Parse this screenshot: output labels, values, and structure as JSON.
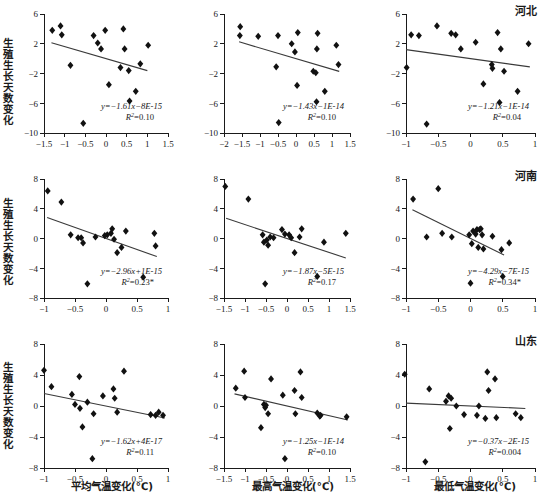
{
  "figure": {
    "width": 547,
    "height": 500,
    "rows": 3,
    "cols": 3,
    "marker_color": "#111111",
    "trend_color": "#3a3a3a",
    "axis_color": "#1a1a1a"
  },
  "axis_titles": {
    "y_label": "生殖生长天数变化",
    "x_labels": [
      "平均气温变化(℃)",
      "最高气温变化(℃)",
      "最低气温变化(℃)"
    ]
  },
  "region_labels": [
    "河北",
    "河南",
    "山东"
  ],
  "chart_data": [
    {
      "type": "scatter",
      "row": 0,
      "col": 0,
      "region": "河北",
      "title": "",
      "xlabel": "平均气温变化(℃)",
      "ylabel": "生殖生长天数变化",
      "xlim": [
        -1.5,
        1.5
      ],
      "ylim": [
        -10,
        6
      ],
      "xticks": [
        -1.5,
        -1,
        -0.5,
        0,
        0.5,
        1,
        1.5
      ],
      "xticklabels": [
        "−1.5",
        "−1",
        "−0.5",
        "0",
        "0.5",
        "1",
        "1.5"
      ],
      "yticks": [
        -10,
        -6,
        -2,
        2,
        6
      ],
      "yticklabels": [
        "−10",
        "−6",
        "−2",
        "2",
        "6"
      ],
      "grid": false,
      "equation": "y=−1.61x−8E-15",
      "r2": "R²=0.10",
      "slope": -1.61,
      "intercept": 0,
      "r_squared": 0.1,
      "significant": false,
      "trend_x": [
        -1.32,
        1.0
      ],
      "points": [
        {
          "x": -1.3,
          "y": 3.8
        },
        {
          "x": -1.1,
          "y": 4.4
        },
        {
          "x": -1.07,
          "y": 3.2
        },
        {
          "x": -0.86,
          "y": -0.9
        },
        {
          "x": -0.3,
          "y": 3.1
        },
        {
          "x": -0.2,
          "y": 2.1
        },
        {
          "x": -0.12,
          "y": 1.3
        },
        {
          "x": -0.02,
          "y": 3.8
        },
        {
          "x": 0.07,
          "y": -3.5
        },
        {
          "x": 0.35,
          "y": -1.2
        },
        {
          "x": 0.42,
          "y": 4.0
        },
        {
          "x": 0.45,
          "y": 1.3
        },
        {
          "x": 0.55,
          "y": -1.6
        },
        {
          "x": 0.57,
          "y": -5.7
        },
        {
          "x": 0.72,
          "y": -4.4
        },
        {
          "x": 0.83,
          "y": -0.7
        },
        {
          "x": 1.02,
          "y": 1.8
        },
        {
          "x": -0.55,
          "y": -8.7
        }
      ]
    },
    {
      "type": "scatter",
      "row": 0,
      "col": 1,
      "region": "河北",
      "title": "",
      "xlabel": "最高气温变化(℃)",
      "ylabel": "生殖生长天数变化",
      "xlim": [
        -2,
        1.5
      ],
      "ylim": [
        -10,
        6
      ],
      "xticks": [
        -2,
        -1.5,
        -1,
        -0.5,
        0,
        0.5,
        1,
        1.5
      ],
      "xticklabels": [
        "−2",
        "−1.5",
        "−1",
        "−0.5",
        "0",
        "0.5",
        "1",
        "1.5"
      ],
      "yticks": [
        -10,
        -6,
        -2,
        2,
        6
      ],
      "yticklabels": [
        "−10",
        "−6",
        "−2",
        "2",
        "6"
      ],
      "grid": false,
      "equation": "y=−1.43x−1E-14",
      "r2": "R²=0.10",
      "slope": -1.43,
      "intercept": 0,
      "r_squared": 0.1,
      "significant": false,
      "trend_x": [
        -1.58,
        1.2
      ],
      "points": [
        {
          "x": -1.55,
          "y": 4.3
        },
        {
          "x": -1.56,
          "y": 3.1
        },
        {
          "x": -1.05,
          "y": 3.0
        },
        {
          "x": -0.55,
          "y": -1.1
        },
        {
          "x": -0.5,
          "y": 3.1
        },
        {
          "x": -0.48,
          "y": -8.6
        },
        {
          "x": -0.12,
          "y": 2.0
        },
        {
          "x": -0.03,
          "y": 0.9
        },
        {
          "x": 0.03,
          "y": -3.6
        },
        {
          "x": 0.05,
          "y": 3.5
        },
        {
          "x": 0.48,
          "y": -1.7
        },
        {
          "x": 0.55,
          "y": -1.9
        },
        {
          "x": 0.57,
          "y": -5.8
        },
        {
          "x": 0.58,
          "y": 1.3
        },
        {
          "x": 0.6,
          "y": 3.4
        },
        {
          "x": 0.8,
          "y": -4.4
        },
        {
          "x": 1.12,
          "y": 1.8
        },
        {
          "x": 1.18,
          "y": -0.8
        }
      ]
    },
    {
      "type": "scatter",
      "row": 0,
      "col": 2,
      "region": "河北",
      "title": "河北",
      "xlabel": "最低气温变化(℃)",
      "ylabel": "生殖生长天数变化",
      "xlim": [
        -1,
        1
      ],
      "ylim": [
        -10,
        6
      ],
      "xticks": [
        -1,
        -0.5,
        0,
        0.5,
        1
      ],
      "xticklabels": [
        "−1",
        "−0.5",
        "0",
        "0.5",
        "1"
      ],
      "yticks": [
        -10,
        -6,
        -2,
        2,
        6
      ],
      "yticklabels": [
        "−10",
        "−6",
        "−2",
        "2",
        "6"
      ],
      "grid": false,
      "equation": "y=−1.21x−1E-14",
      "r2": "R²=0.04",
      "slope": -1.21,
      "intercept": 0,
      "r_squared": 0.04,
      "significant": false,
      "trend_x": [
        -1.0,
        0.92
      ],
      "points": [
        {
          "x": -0.99,
          "y": -1.2
        },
        {
          "x": -0.92,
          "y": 3.2
        },
        {
          "x": -0.8,
          "y": 3.1
        },
        {
          "x": -0.68,
          "y": -8.8
        },
        {
          "x": -0.52,
          "y": 4.4
        },
        {
          "x": -0.3,
          "y": 3.4
        },
        {
          "x": -0.23,
          "y": 3.2
        },
        {
          "x": -0.15,
          "y": 1.3
        },
        {
          "x": 0.08,
          "y": 2.2
        },
        {
          "x": 0.2,
          "y": -3.4
        },
        {
          "x": 0.33,
          "y": -0.8
        },
        {
          "x": 0.34,
          "y": -1.3
        },
        {
          "x": 0.42,
          "y": 3.5
        },
        {
          "x": 0.45,
          "y": -5.9
        },
        {
          "x": 0.47,
          "y": 1.3
        },
        {
          "x": 0.52,
          "y": -1.7
        },
        {
          "x": 0.73,
          "y": -4.4
        },
        {
          "x": 0.9,
          "y": 2.0
        }
      ]
    },
    {
      "type": "scatter",
      "row": 1,
      "col": 0,
      "region": "河南",
      "title": "",
      "xlabel": "平均气温变化(℃)",
      "ylabel": "生殖生长天数变化",
      "xlim": [
        -1,
        1
      ],
      "ylim": [
        -8,
        8
      ],
      "xticks": [
        -1,
        -0.5,
        0,
        0.5,
        1
      ],
      "xticklabels": [
        "−1",
        "−0.5",
        "0",
        "0.5",
        "1"
      ],
      "yticks": [
        -8,
        -4,
        0,
        4,
        8
      ],
      "yticklabels": [
        "−8",
        "−4",
        "0",
        "4",
        "8"
      ],
      "grid": false,
      "equation": "y=−2.96x+1E-15",
      "r2": "R²=0.23*",
      "slope": -2.96,
      "intercept": 0,
      "r_squared": 0.23,
      "significant": true,
      "trend_x": [
        -0.95,
        0.82
      ],
      "points": [
        {
          "x": -0.94,
          "y": 6.4
        },
        {
          "x": -0.72,
          "y": 4.9
        },
        {
          "x": -0.57,
          "y": 0.5
        },
        {
          "x": -0.45,
          "y": 0.1
        },
        {
          "x": -0.4,
          "y": 0.1
        },
        {
          "x": -0.37,
          "y": -0.6
        },
        {
          "x": -0.3,
          "y": -6.1
        },
        {
          "x": -0.17,
          "y": 0.2
        },
        {
          "x": -0.02,
          "y": 0.4
        },
        {
          "x": 0.02,
          "y": 0.5
        },
        {
          "x": 0.08,
          "y": 0.7
        },
        {
          "x": 0.1,
          "y": 1.3
        },
        {
          "x": 0.13,
          "y": -0.1
        },
        {
          "x": 0.18,
          "y": -1.9
        },
        {
          "x": 0.25,
          "y": -1.2
        },
        {
          "x": 0.32,
          "y": 1.0
        },
        {
          "x": 0.6,
          "y": -5.2
        },
        {
          "x": 0.78,
          "y": 0.7
        },
        {
          "x": 0.8,
          "y": -1.0
        }
      ]
    },
    {
      "type": "scatter",
      "row": 1,
      "col": 1,
      "region": "河南",
      "title": "",
      "xlabel": "最高气温变化(℃)",
      "ylabel": "生殖生长天数变化",
      "xlim": [
        -1.5,
        1.5
      ],
      "ylim": [
        -8,
        8
      ],
      "xticks": [
        -1.5,
        -1,
        -0.5,
        0,
        0.5,
        1,
        1.5
      ],
      "xticklabels": [
        "−1.5",
        "−1",
        "−0.5",
        "0",
        "0.5",
        "1",
        "1.5"
      ],
      "yticks": [
        -8,
        -4,
        0,
        4,
        8
      ],
      "yticklabels": [
        "−8",
        "−4",
        "0",
        "4",
        "8"
      ],
      "grid": false,
      "equation": "y=−1.87x−5E-15",
      "r2": "R²=0.17",
      "slope": -1.87,
      "intercept": 0,
      "r_squared": 0.17,
      "significant": false,
      "trend_x": [
        -1.45,
        1.4
      ],
      "points": [
        {
          "x": -1.47,
          "y": 7.0
        },
        {
          "x": -0.92,
          "y": 5.3
        },
        {
          "x": -0.58,
          "y": 0.5
        },
        {
          "x": -0.55,
          "y": -0.5
        },
        {
          "x": -0.52,
          "y": -6.1
        },
        {
          "x": -0.48,
          "y": -0.2
        },
        {
          "x": -0.45,
          "y": -0.9
        },
        {
          "x": -0.4,
          "y": 0.2
        },
        {
          "x": -0.32,
          "y": 0.1
        },
        {
          "x": -0.12,
          "y": 1.2
        },
        {
          "x": -0.05,
          "y": 0.6
        },
        {
          "x": 0.05,
          "y": 0.5
        },
        {
          "x": 0.1,
          "y": 0.1
        },
        {
          "x": 0.18,
          "y": -1.9
        },
        {
          "x": 0.3,
          "y": 0.2
        },
        {
          "x": 0.35,
          "y": 1.3
        },
        {
          "x": 0.72,
          "y": -5.1
        },
        {
          "x": 0.88,
          "y": -0.5
        },
        {
          "x": 1.4,
          "y": 0.7
        }
      ]
    },
    {
      "type": "scatter",
      "row": 1,
      "col": 2,
      "region": "河南",
      "title": "河南",
      "xlabel": "最低气温变化(℃)",
      "ylabel": "生殖生长天数变化",
      "xlim": [
        -1,
        1
      ],
      "ylim": [
        -8,
        8
      ],
      "xticks": [
        -1,
        -0.5,
        0,
        0.5,
        1
      ],
      "xticklabels": [
        "−1",
        "−0.5",
        "0",
        "0.5",
        "1"
      ],
      "yticks": [
        -8,
        -4,
        0,
        4,
        8
      ],
      "yticklabels": [
        "−8",
        "−4",
        "0",
        "4",
        "8"
      ],
      "grid": false,
      "equation": "y=−4.29x−7E-15",
      "r2": "R²=0.34*",
      "slope": -4.29,
      "intercept": 0,
      "r_squared": 0.34,
      "significant": true,
      "trend_x": [
        -0.9,
        0.52
      ],
      "points": [
        {
          "x": -0.89,
          "y": 5.3
        },
        {
          "x": -0.68,
          "y": 0.2
        },
        {
          "x": -0.5,
          "y": 6.7
        },
        {
          "x": -0.44,
          "y": 0.7
        },
        {
          "x": -0.29,
          "y": 0.2
        },
        {
          "x": -0.02,
          "y": 0.5
        },
        {
          "x": 0.0,
          "y": -6.0
        },
        {
          "x": 0.02,
          "y": -0.7
        },
        {
          "x": 0.04,
          "y": 1.0
        },
        {
          "x": 0.08,
          "y": 0.6
        },
        {
          "x": 0.1,
          "y": 1.2
        },
        {
          "x": 0.12,
          "y": -1.2
        },
        {
          "x": 0.14,
          "y": 1.2
        },
        {
          "x": 0.16,
          "y": 1.3
        },
        {
          "x": 0.18,
          "y": 0.5
        },
        {
          "x": 0.2,
          "y": -1.4
        },
        {
          "x": 0.34,
          "y": 0.3
        },
        {
          "x": 0.48,
          "y": -1.5
        },
        {
          "x": 0.5,
          "y": -5.1
        },
        {
          "x": 0.6,
          "y": -0.6
        }
      ]
    },
    {
      "type": "scatter",
      "row": 2,
      "col": 0,
      "region": "山东",
      "title": "",
      "xlabel": "平均气温变化(℃)",
      "ylabel": "生殖生长天数变化",
      "xlim": [
        -1,
        1
      ],
      "ylim": [
        -8,
        8
      ],
      "xticks": [
        -1,
        -0.5,
        0,
        0.5,
        1
      ],
      "xticklabels": [
        "−1",
        "−0.5",
        "0",
        "0.5",
        "1"
      ],
      "yticks": [
        -8,
        -4,
        0,
        4,
        8
      ],
      "yticklabels": [
        "−8",
        "−4",
        "0",
        "4",
        "8"
      ],
      "grid": false,
      "equation": "y=−1.62x+4E-17",
      "r2": "R²=0.11",
      "slope": -1.62,
      "intercept": 0,
      "r_squared": 0.11,
      "significant": false,
      "trend_x": [
        -1.0,
        0.95
      ],
      "points": [
        {
          "x": -1.0,
          "y": 4.6
        },
        {
          "x": -0.88,
          "y": 2.5
        },
        {
          "x": -0.55,
          "y": 1.5
        },
        {
          "x": -0.5,
          "y": 0.2
        },
        {
          "x": -0.43,
          "y": 3.8
        },
        {
          "x": -0.42,
          "y": -0.3
        },
        {
          "x": -0.38,
          "y": -2.7
        },
        {
          "x": -0.3,
          "y": 0.5
        },
        {
          "x": -0.22,
          "y": -6.8
        },
        {
          "x": -0.2,
          "y": -1.0
        },
        {
          "x": -0.05,
          "y": 1.3
        },
        {
          "x": 0.12,
          "y": 2.2
        },
        {
          "x": 0.14,
          "y": 1.0
        },
        {
          "x": 0.18,
          "y": -0.8
        },
        {
          "x": 0.29,
          "y": 4.5
        },
        {
          "x": 0.72,
          "y": -1.1
        },
        {
          "x": 0.8,
          "y": -1.2
        },
        {
          "x": 0.85,
          "y": -0.8
        },
        {
          "x": 0.92,
          "y": -1.2
        }
      ]
    },
    {
      "type": "scatter",
      "row": 2,
      "col": 1,
      "region": "山东",
      "title": "",
      "xlabel": "最高气温变化(℃)",
      "ylabel": "生殖生长天数变化",
      "xlim": [
        -1.5,
        1.5
      ],
      "ylim": [
        -8,
        8
      ],
      "xticks": [
        -1.5,
        -1,
        -0.5,
        0,
        0.5,
        1,
        1.5
      ],
      "xticklabels": [
        "−1.5",
        "−1",
        "−0.5",
        "0",
        "0.5",
        "1",
        "1.5"
      ],
      "yticks": [
        -8,
        -4,
        0,
        4,
        8
      ],
      "yticklabels": [
        "−8",
        "−4",
        "0",
        "4",
        "8"
      ],
      "grid": false,
      "equation": "y=−1.25x−1E-14",
      "r2": "R²=0.10",
      "slope": -1.25,
      "intercept": 0,
      "r_squared": 0.1,
      "significant": false,
      "trend_x": [
        -1.25,
        1.45
      ],
      "points": [
        {
          "x": -1.22,
          "y": 2.3
        },
        {
          "x": -1.02,
          "y": 4.5
        },
        {
          "x": -1.0,
          "y": 1.1
        },
        {
          "x": -0.62,
          "y": -2.8
        },
        {
          "x": -0.55,
          "y": 0.2
        },
        {
          "x": -0.52,
          "y": -0.2
        },
        {
          "x": -0.5,
          "y": 0.1
        },
        {
          "x": -0.45,
          "y": -1.0
        },
        {
          "x": -0.38,
          "y": 3.5
        },
        {
          "x": -0.1,
          "y": 1.4
        },
        {
          "x": -0.05,
          "y": -6.8
        },
        {
          "x": 0.18,
          "y": 2.0
        },
        {
          "x": 0.2,
          "y": -1.0
        },
        {
          "x": 0.32,
          "y": 4.4
        },
        {
          "x": 0.35,
          "y": 1.1
        },
        {
          "x": 0.72,
          "y": -0.9
        },
        {
          "x": 0.78,
          "y": -1.3
        },
        {
          "x": 0.8,
          "y": -1.2
        },
        {
          "x": 1.42,
          "y": -1.4
        }
      ]
    },
    {
      "type": "scatter",
      "row": 2,
      "col": 2,
      "region": "山东",
      "title": "山东",
      "xlabel": "最低气温变化(℃)",
      "ylabel": "生殖生长天数变化",
      "xlim": [
        -1,
        1
      ],
      "ylim": [
        -8,
        8
      ],
      "xticks": [
        -1,
        -0.5,
        0,
        0.5,
        1
      ],
      "xticklabels": [
        "−1",
        "−0.5",
        "0",
        "0.5",
        "1"
      ],
      "yticks": [
        -8,
        -4,
        0,
        4,
        8
      ],
      "yticklabels": [
        "−8",
        "−4",
        "0",
        "4",
        "8"
      ],
      "grid": false,
      "equation": "y=−0.37x−2E-15",
      "r2": "R²=0.004",
      "slope": -0.37,
      "intercept": 0,
      "r_squared": 0.004,
      "significant": false,
      "trend_x": [
        -1.0,
        0.85
      ],
      "points": [
        {
          "x": -1.02,
          "y": 4.1
        },
        {
          "x": -0.7,
          "y": -7.2
        },
        {
          "x": -0.64,
          "y": 2.2
        },
        {
          "x": -0.38,
          "y": 0.6
        },
        {
          "x": -0.34,
          "y": 1.3
        },
        {
          "x": -0.32,
          "y": -2.9
        },
        {
          "x": -0.3,
          "y": 1.0
        },
        {
          "x": -0.22,
          "y": 0.0
        },
        {
          "x": -0.1,
          "y": -1.1
        },
        {
          "x": 0.1,
          "y": -1.2
        },
        {
          "x": 0.13,
          "y": 0.0
        },
        {
          "x": 0.23,
          "y": -1.6
        },
        {
          "x": 0.26,
          "y": 4.4
        },
        {
          "x": 0.28,
          "y": 2.0
        },
        {
          "x": 0.38,
          "y": 3.5
        },
        {
          "x": 0.4,
          "y": -1.5
        },
        {
          "x": 0.7,
          "y": -1.0
        },
        {
          "x": 0.78,
          "y": -1.5
        }
      ]
    }
  ]
}
